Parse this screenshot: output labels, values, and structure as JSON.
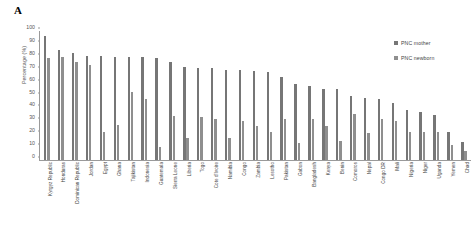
{
  "panel": {
    "label": "A"
  },
  "legend": {
    "position": "right",
    "entries": [
      {
        "name": "PNC mother",
        "color": "#767676"
      },
      {
        "name": "PNC newborn",
        "color": "#8f8f8f"
      }
    ]
  },
  "chart_data": {
    "type": "bar",
    "title": "",
    "subtitle": "",
    "xlabel": "",
    "ylabel": "Percentage (%)",
    "ylim": [
      0,
      100
    ],
    "yticks": [
      0,
      10,
      20,
      30,
      40,
      50,
      60,
      70,
      80,
      90,
      100
    ],
    "grid": false,
    "legend_position": "right",
    "categories": [
      "Kyrgyz Republic",
      "Honduras",
      "Dominican Republic",
      "Jordan",
      "Egypt",
      "Ghana",
      "Tajikistan",
      "Indonesia",
      "Guatemala",
      "Sierra Leone",
      "Liberia",
      "Togo",
      "Cote d'Ivoire",
      "Namibia",
      "Congo",
      "Zambia",
      "Lesotho",
      "Pakistan",
      "Gabon",
      "Bangladesh",
      "Kenya",
      "Benin",
      "Comoros",
      "Nepal",
      "Congo DR",
      "Mali",
      "Nigeria",
      "Niger",
      "Uganda",
      "Yemen",
      "Chad"
    ],
    "series": [
      {
        "name": "PNC mother",
        "color": "#767676",
        "values": [
          96,
          85,
          83,
          81,
          81,
          80,
          80,
          80,
          79,
          76,
          72,
          71,
          71,
          70,
          70,
          69,
          68,
          64,
          59,
          57,
          55,
          55,
          50,
          48,
          47,
          44,
          39,
          37,
          35,
          22,
          14
        ]
      },
      {
        "name": "PNC newborn",
        "color": "#8f8f8f",
        "values": [
          79,
          80,
          76,
          74,
          22,
          27,
          53,
          47,
          10,
          34,
          17,
          33,
          32,
          17,
          30,
          26,
          22,
          32,
          13,
          32,
          26,
          15,
          36,
          21,
          32,
          30,
          22,
          22,
          22,
          12,
          7
        ]
      }
    ]
  }
}
